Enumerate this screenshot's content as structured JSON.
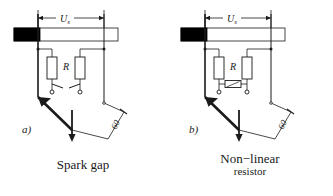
{
  "figure": {
    "background_color": "#ffffff",
    "line_color": "#1a1a1a",
    "busbar_fill": "#000000",
    "insulator_fill": "#ffffff"
  },
  "panels": [
    {
      "id": "a",
      "index_label": "a)",
      "dimension_label": "Us",
      "dimension_label_main": "U",
      "dimension_label_sub": "s",
      "resistor_label": "R",
      "angle_label": "60",
      "element_type": "spark-gap",
      "caption": "Spark gap",
      "caption_line1": "Spark gap",
      "caption_line2": ""
    },
    {
      "id": "b",
      "index_label": "b)",
      "dimension_label": "Us",
      "dimension_label_main": "U",
      "dimension_label_sub": "s",
      "resistor_label": "R",
      "angle_label": "60",
      "element_type": "non-linear-resistor",
      "caption": "Non−linear resistor",
      "caption_line1": "Non−linear",
      "caption_line2": "resistor"
    }
  ]
}
